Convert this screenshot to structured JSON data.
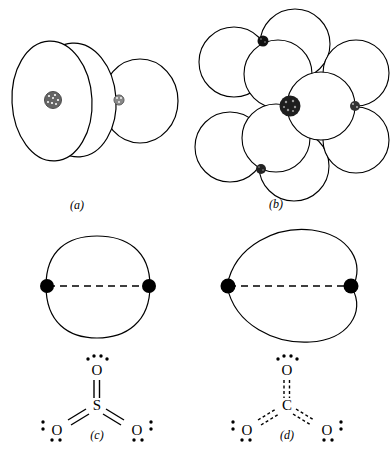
{
  "figure": {
    "background_color": "#ffffff",
    "ink_color": "#000000",
    "panel_count": 4
  },
  "panels": [
    {
      "id": "a",
      "label": "(a)",
      "caption_text": "(a)",
      "description": "perspective overlapping ellipsoidal electron-cloud lobes",
      "lobe_count": 3,
      "nuclei": [
        {
          "name": "large-nucleus",
          "style": "stippled",
          "size": "large"
        },
        {
          "name": "small-nucleus",
          "style": "stippled",
          "size": "small"
        }
      ]
    },
    {
      "id": "b",
      "label": "(b)",
      "caption_text": "(b)",
      "description": "planar trigonal arrangement of circular electron-cloud lobes",
      "central_nucleus": {
        "name": "central-nucleus",
        "style": "stippled-dark",
        "size": "large"
      },
      "peripheral_nuclei_count": 3,
      "lobe_count": 9
    },
    {
      "id": "c",
      "label": "(c)",
      "caption_text": "(c)",
      "description": "rounded-square cross-section contour with two nuclei on dashed internuclear axis",
      "nuclei_count": 2,
      "axis_style": "dashed"
    },
    {
      "id": "d",
      "label": "(d)",
      "caption_text": "(d)",
      "description": "cardioid (heart-shaped) cross-section contour with two nuclei on dashed internuclear axis",
      "nuclei_count": 2,
      "axis_style": "dashed"
    }
  ],
  "lewis_structures": [
    {
      "panel": "c",
      "name": "sulfur-trioxide",
      "central_atom": "S",
      "terminal_atoms": [
        "O",
        "O",
        "O"
      ],
      "bond_style": "double",
      "bond_render": "solid",
      "lone_pairs_per_terminal": 2,
      "atoms": {
        "center": "S",
        "top": "O",
        "bottom_left": "O",
        "bottom_right": "O"
      }
    },
    {
      "panel": "d",
      "name": "carbonate",
      "central_atom": "C",
      "terminal_atoms": [
        "O",
        "O",
        "O"
      ],
      "bond_style": "double",
      "bond_render": "dashed",
      "lone_pairs_per_terminal": 2,
      "atoms": {
        "center": "C",
        "top": "O",
        "bottom_left": "O",
        "bottom_right": "O"
      }
    }
  ]
}
